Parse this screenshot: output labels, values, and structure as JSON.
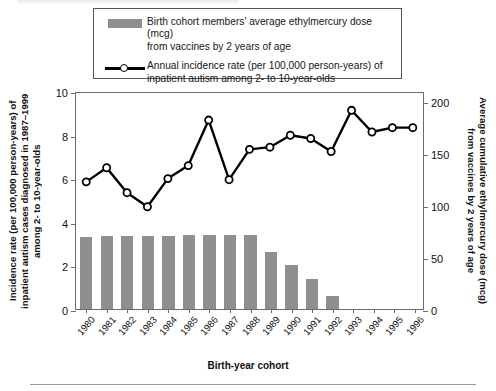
{
  "legend": {
    "items": [
      {
        "key": "bar-swatch",
        "line1": "Birth cohort members' average ethylmercury dose (mcg)",
        "line2": "from vaccines by 2 years of age"
      },
      {
        "key": "line-marker-swatch",
        "line1": "Annual incidence rate (per 100,000 person-years) of",
        "line2": "inpatient autism among 2- to 10-year-olds"
      }
    ]
  },
  "axes": {
    "y_left_title": "Incidence rate (per 100,000 person-years) of inpatient autism cases diagnosed in 1987–1999 among 2- to 10-year-olds",
    "y_right_title": "Average cumulative ethylmercury dose (mcg) from vaccines by 2 years of age",
    "x_title": "Birth-year cohort",
    "y_left_ticks": [
      "0",
      "2",
      "4",
      "6",
      "8",
      "10"
    ],
    "y_right_ticks": [
      "0",
      "50",
      "100",
      "150",
      "200"
    ]
  },
  "colors": {
    "bar": "#8f8f8f",
    "line": "#000000",
    "marker_fill": "#ffffff",
    "frame": "#6b6b6b",
    "background": "#ffffff"
  },
  "chart_data": {
    "type": "bar",
    "title": "",
    "xlabel": "Birth-year cohort",
    "ylabel": "Incidence rate (per 100,000 person-years) of inpatient autism cases diagnosed in 1987–1999 among 2- to 10-year-olds",
    "y2label": "Average cumulative ethylmercury dose (mcg) from vaccines by 2 years of age",
    "categories": [
      "1980",
      "1981",
      "1982",
      "1983",
      "1984",
      "1985",
      "1986",
      "1987",
      "1988",
      "1989",
      "1990",
      "1991",
      "1992",
      "1993",
      "1994",
      "1995",
      "1996"
    ],
    "ylim": [
      0,
      10
    ],
    "y2lim": [
      0,
      210
    ],
    "yticks": [
      0,
      2,
      4,
      6,
      8,
      10
    ],
    "y2ticks": [
      0,
      50,
      100,
      150,
      200
    ],
    "grid": false,
    "legend_position": "top",
    "series": [
      {
        "name": "Birth cohort members' average ethylmercury dose (mcg) from vaccines by 2 years of age",
        "type": "bar",
        "axis": "right",
        "unit": "mcg",
        "values": [
          69,
          70,
          70,
          70,
          70,
          71,
          71,
          71,
          71,
          55,
          42,
          29,
          13,
          null,
          null,
          null,
          null
        ]
      },
      {
        "name": "Annual incidence rate (per 100,000 person-years) of inpatient autism among 2- to 10-year-olds",
        "type": "line",
        "axis": "left",
        "marker": "open-circle",
        "values": [
          5.9,
          6.55,
          5.4,
          4.75,
          6.05,
          6.65,
          8.75,
          6.0,
          7.4,
          7.5,
          8.05,
          7.9,
          7.3,
          9.2,
          8.2,
          8.4,
          8.4
        ]
      }
    ]
  }
}
